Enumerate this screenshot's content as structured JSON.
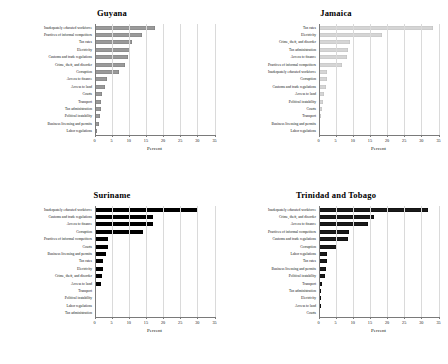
{
  "figure": {
    "panels_order": [
      "guyana",
      "jamaica",
      "suriname",
      "trinidad"
    ]
  },
  "chart_data": [
    {
      "id": "guyana",
      "type": "bar",
      "orientation": "horizontal",
      "title": "Guyana",
      "xlabel": "Percent",
      "ylabel": "",
      "xlim": [
        0,
        35
      ],
      "xticks": [
        0,
        5,
        10,
        15,
        20,
        25,
        30,
        35
      ],
      "xticklabels": [
        "0",
        "5",
        "10",
        "15",
        "20",
        "25",
        "30",
        "35"
      ],
      "grid": true,
      "grid_axis": "x",
      "legend": "none",
      "bar_color": "#9a9a9a",
      "bar_edge_color": "#6f6f6f",
      "categories": [
        "Inadequately educated workforce",
        "Practices of informal competitors",
        "Tax rates",
        "Electricity",
        "Customs and trade regulations",
        "Crime, theft, and disorder",
        "Corruption",
        "Access to finance",
        "Access to land",
        "Courts",
        "Transport",
        "Tax administration",
        "Political instability",
        "Business licensing and permits",
        "Labor regulations"
      ],
      "values": [
        17.6,
        13.8,
        11.0,
        10.3,
        9.7,
        8.9,
        7.1,
        3.6,
        3.2,
        2.3,
        1.9,
        1.8,
        1.6,
        1.2,
        0.6
      ]
    },
    {
      "id": "jamaica",
      "type": "bar",
      "orientation": "horizontal",
      "title": "Jamaica",
      "xlabel": "Percent",
      "ylabel": "",
      "xlim": [
        0,
        35
      ],
      "xticks": [
        0,
        5,
        10,
        15,
        20,
        25,
        30,
        35
      ],
      "xticklabels": [
        "0",
        "5",
        "10",
        "15",
        "20",
        "25",
        "30",
        "35"
      ],
      "grid": true,
      "grid_axis": "x",
      "legend": "none",
      "bar_color": "#d5d5d5",
      "bar_edge_color": "#b5b5b5",
      "categories": [
        "Tax rates",
        "Electricity",
        "Crime, theft, and disorder",
        "Tax administration",
        "Access to finance",
        "Practices of informal competitors",
        "Inadequately educated workforce",
        "Corruption",
        "Customs and trade regulations",
        "Access to land",
        "Political instability",
        "Courts",
        "Transport",
        "Business licensing and permits",
        "Labor regulations"
      ],
      "values": [
        33.4,
        18.4,
        9.1,
        8.7,
        8.4,
        6.8,
        2.6,
        2.4,
        2.3,
        1.7,
        1.4,
        0.9,
        0.6,
        0.3,
        0.2
      ]
    },
    {
      "id": "suriname",
      "type": "bar",
      "orientation": "horizontal",
      "title": "Suriname",
      "xlabel": "Percent",
      "ylabel": "",
      "xlim": [
        0,
        35
      ],
      "xticks": [
        0,
        5,
        10,
        15,
        20,
        25,
        30,
        35
      ],
      "xticklabels": [
        "0",
        "5",
        "10",
        "15",
        "20",
        "25",
        "30",
        "35"
      ],
      "grid": true,
      "grid_axis": "x",
      "legend": "none",
      "bar_color": "#000000",
      "bar_edge_color": "#000000",
      "categories": [
        "Inadequately educated workforce",
        "Customs and trade regulations",
        "Access to finance",
        "Corruption",
        "Practices of informal competitors",
        "Courts",
        "Business licensing and permits",
        "Tax rates",
        "Electricity",
        "Crime, theft, and disorder",
        "Access to land",
        "Transport",
        "Political instability",
        "Labor regulations",
        "Tax administration"
      ],
      "values": [
        30.1,
        17.1,
        17.0,
        14.0,
        3.9,
        3.8,
        3.3,
        2.5,
        2.4,
        2.1,
        2.0,
        0.5,
        0.5,
        0.4,
        0.1
      ]
    },
    {
      "id": "trinidad",
      "type": "bar",
      "orientation": "horizontal",
      "title": "Trinidad and Tobago",
      "xlabel": "Percent",
      "ylabel": "",
      "xlim": [
        0,
        35
      ],
      "xticks": [
        0,
        5,
        10,
        15,
        20,
        25,
        30,
        35
      ],
      "xticklabels": [
        "0",
        "5",
        "10",
        "15",
        "20",
        "25",
        "30",
        "35"
      ],
      "grid": true,
      "grid_axis": "x",
      "legend": "none",
      "bar_color": "#1a1a1a",
      "bar_edge_color": "#000000",
      "categories": [
        "Inadequately educated workforce",
        "Crime, theft, and disorder",
        "Access to finance",
        "Practices of informal competitors",
        "Customs and trade regulations",
        "Corruption",
        "Labor regulations",
        "Tax rates",
        "Business licensing and permits",
        "Political instability",
        "Transport",
        "Tax administration",
        "Electricity",
        "Access to land",
        "Courts"
      ],
      "values": [
        31.8,
        16.3,
        14.4,
        8.8,
        8.7,
        5.5,
        2.5,
        2.4,
        2.3,
        2.0,
        1.0,
        0.8,
        0.7,
        0.6,
        0.5
      ]
    }
  ]
}
